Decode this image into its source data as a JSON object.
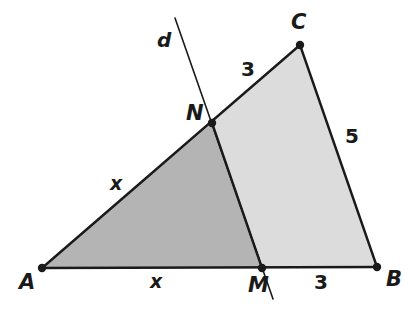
{
  "figure": {
    "kind": "geometry-diagram",
    "background_color": "#ffffff",
    "stroke_color": "#1a1a1a",
    "regions": [
      {
        "name": "triangle-ANM",
        "fill": "#b4b4b4",
        "vertices": [
          "A",
          "N",
          "M"
        ]
      },
      {
        "name": "quadrilateral-NCBM",
        "fill": "#dcdcdc",
        "vertices": [
          "N",
          "C",
          "B",
          "M"
        ]
      }
    ],
    "points": [
      {
        "id": "A",
        "label": "A",
        "x": 42,
        "y": 268,
        "label_x": 19,
        "label_y": 272
      },
      {
        "id": "B",
        "label": "B",
        "x": 377,
        "y": 267,
        "label_x": 386,
        "label_y": 269
      },
      {
        "id": "C",
        "label": "C",
        "x": 300,
        "y": 45,
        "label_x": 291,
        "label_y": 12
      },
      {
        "id": "M",
        "label": "M",
        "x": 262,
        "y": 268,
        "label_x": 248,
        "label_y": 275
      },
      {
        "id": "N",
        "label": "N",
        "x": 212,
        "y": 123,
        "label_x": 186,
        "label_y": 103
      }
    ],
    "segments": [
      {
        "name": "side-AB",
        "from": "A",
        "to": "B"
      },
      {
        "name": "side-AC",
        "from": "A",
        "to": "C"
      },
      {
        "name": "side-CB",
        "from": "C",
        "to": "B"
      },
      {
        "name": "segment-NM",
        "from": "N",
        "to": "M"
      }
    ],
    "line": {
      "name": "line-d",
      "label": "d",
      "label_x": 157,
      "label_y": 30,
      "x1": 175,
      "y1": 18,
      "x2": 273,
      "y2": 299
    },
    "measures": [
      {
        "name": "length-AN",
        "text": "x",
        "x": 110,
        "y": 174,
        "italic": true
      },
      {
        "name": "length-NC",
        "text": "3",
        "x": 241,
        "y": 59,
        "italic": false
      },
      {
        "name": "length-CB",
        "text": "5",
        "x": 345,
        "y": 126,
        "italic": false
      },
      {
        "name": "length-AM",
        "text": "x",
        "x": 150,
        "y": 272,
        "italic": true
      },
      {
        "name": "length-MB",
        "text": "3",
        "x": 314,
        "y": 272,
        "italic": false
      }
    ]
  }
}
